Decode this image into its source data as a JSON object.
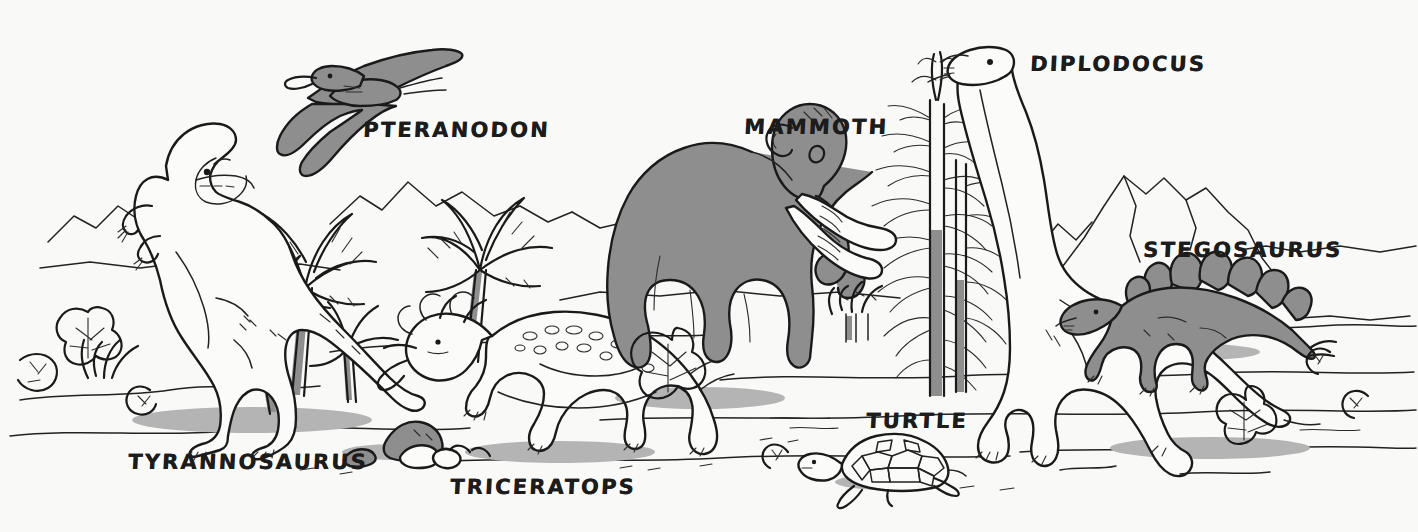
{
  "scene": {
    "title": "Prehistoric Scene",
    "background_color": "#f9f9f7",
    "ink_color": "#1a1a1a",
    "fill_gray": "#8e8e8e",
    "shadow_gray": "#b4b4b4",
    "width": 1418,
    "height": 532
  },
  "labels": [
    {
      "id": "pteranodon",
      "text": "PTERANODON",
      "x": 363,
      "y": 120
    },
    {
      "id": "mammoth",
      "text": "MAMMOTH",
      "x": 744,
      "y": 117
    },
    {
      "id": "diplodocus",
      "text": "DIPLODOCUS",
      "x": 1030,
      "y": 54
    },
    {
      "id": "stegosaurus",
      "text": "STEGOSAURUS",
      "x": 1143,
      "y": 240
    },
    {
      "id": "turtle",
      "text": "TURTLE",
      "x": 866,
      "y": 411
    },
    {
      "id": "tyrannosaurus",
      "text": "TYRANNOSAURUS",
      "x": 128,
      "y": 452
    },
    {
      "id": "triceratops",
      "text": "TRICERATOPS",
      "x": 450,
      "y": 477
    }
  ],
  "creatures": [
    {
      "id": "tyrannosaurus",
      "name": "Tyrannosaurus",
      "fill": "white",
      "position": "left-foreground"
    },
    {
      "id": "pteranodon",
      "name": "Pteranodon",
      "fill": "gray",
      "position": "upper-left-sky"
    },
    {
      "id": "triceratops",
      "name": "Triceratops",
      "fill": "white",
      "position": "lower-center-left"
    },
    {
      "id": "mammoth",
      "name": "Mammoth",
      "fill": "gray",
      "position": "center"
    },
    {
      "id": "turtle",
      "name": "Turtle",
      "fill": "white",
      "position": "lower-center-right"
    },
    {
      "id": "diplodocus",
      "name": "Diplodocus",
      "fill": "white",
      "position": "right-center"
    },
    {
      "id": "stegosaurus",
      "name": "Stegosaurus",
      "fill": "gray",
      "position": "right-background"
    }
  ],
  "scenery": [
    {
      "id": "palm-trees",
      "name": "Palm Trees",
      "count": 4
    },
    {
      "id": "conifers",
      "name": "Conifer Trees",
      "count": 2
    },
    {
      "id": "mountains",
      "name": "Background Mountains",
      "count": 3
    },
    {
      "id": "rocks",
      "name": "Rocks",
      "count": 2
    },
    {
      "id": "ferns",
      "name": "Ferns and Shrubs",
      "count": 8
    }
  ]
}
